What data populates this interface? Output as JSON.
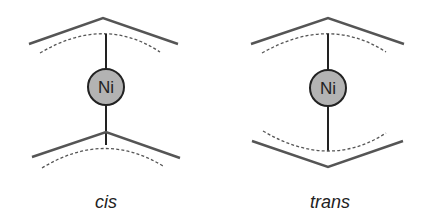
{
  "diagram": {
    "panels": [
      {
        "id": "cis",
        "caption": "cis",
        "center_atom": "Ni",
        "atom_fill": "#b3b3b3",
        "top_ligand_orientation": "apex-up",
        "bottom_ligand_orientation": "apex-up"
      },
      {
        "id": "trans",
        "caption": "trans",
        "center_atom": "Ni",
        "atom_fill": "#b3b3b3",
        "top_ligand_orientation": "apex-up",
        "bottom_ligand_orientation": "apex-down"
      }
    ]
  }
}
